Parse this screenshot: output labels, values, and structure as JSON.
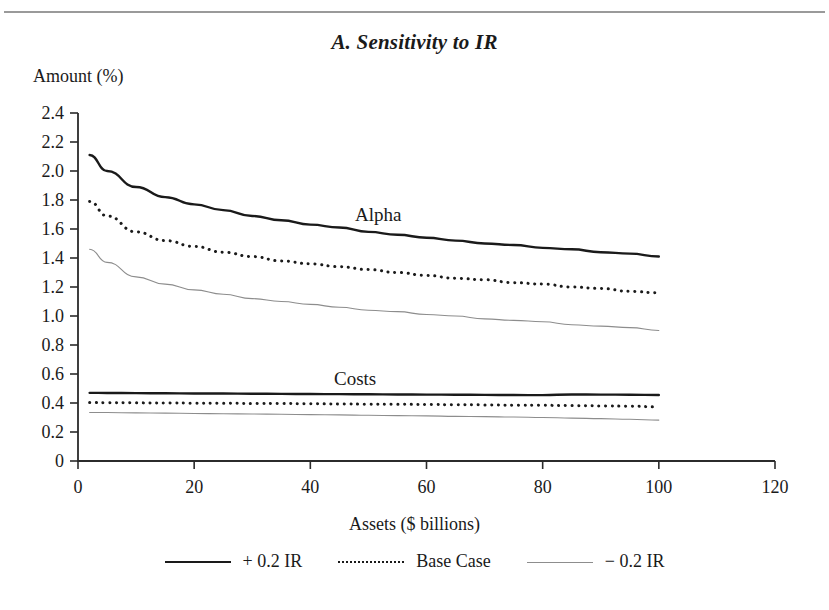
{
  "page": {
    "background_color": "#ffffff",
    "rule_color": "#9a9a9a"
  },
  "header": {
    "title": "A. Sensitivity to IR"
  },
  "annotations": {
    "alpha_label": "Alpha",
    "costs_label": "Costs"
  },
  "legend": {
    "items": [
      {
        "label": "+ 0.2 IR",
        "style": "solid",
        "color": "#1a1a1a"
      },
      {
        "label": "Base Case",
        "style": "dotted",
        "color": "#1a1a1a"
      },
      {
        "label": "− 0.2 IR",
        "style": "thin",
        "color": "#8d8d8d"
      }
    ]
  },
  "chart_data": {
    "type": "line",
    "title": "A. Sensitivity to IR",
    "xlabel": "Assets ($ billions)",
    "ylabel": "Amount (%)",
    "xlim": [
      0,
      120
    ],
    "ylim": [
      0,
      2.4
    ],
    "grid": false,
    "legend_position": "bottom",
    "xticks": [
      "0",
      "20",
      "40",
      "60",
      "80",
      "100",
      "120"
    ],
    "xtick_values": [
      0,
      20,
      40,
      60,
      80,
      100,
      120
    ],
    "yticks": [
      "0",
      "0.2",
      "0.4",
      "0.6",
      "0.8",
      "1.0",
      "1.2",
      "1.4",
      "1.6",
      "1.8",
      "2.0",
      "2.2",
      "2.4"
    ],
    "ytick_values": [
      0,
      0.2,
      0.4,
      0.6,
      0.8,
      1.0,
      1.2,
      1.4,
      1.6,
      1.8,
      2.0,
      2.2,
      2.4
    ],
    "x": [
      2,
      5,
      10,
      15,
      20,
      25,
      30,
      35,
      40,
      45,
      50,
      55,
      60,
      65,
      70,
      75,
      80,
      85,
      90,
      95,
      100
    ],
    "series": [
      {
        "name": "+ 0.2 IR",
        "group": "Alpha",
        "style": "solid",
        "color": "#1a1a1a",
        "values": [
          2.11,
          2.0,
          1.89,
          1.82,
          1.77,
          1.73,
          1.69,
          1.66,
          1.63,
          1.61,
          1.58,
          1.56,
          1.54,
          1.52,
          1.5,
          1.49,
          1.47,
          1.46,
          1.44,
          1.43,
          1.41
        ]
      },
      {
        "name": "Base Case",
        "group": "Alpha",
        "style": "dotted",
        "color": "#1a1a1a",
        "values": [
          1.79,
          1.69,
          1.58,
          1.52,
          1.48,
          1.44,
          1.41,
          1.38,
          1.36,
          1.34,
          1.32,
          1.3,
          1.28,
          1.26,
          1.25,
          1.23,
          1.22,
          1.2,
          1.19,
          1.17,
          1.16
        ]
      },
      {
        "name": "− 0.2 IR",
        "group": "Alpha",
        "style": "thin",
        "color": "#8d8d8d",
        "values": [
          1.46,
          1.37,
          1.27,
          1.22,
          1.18,
          1.15,
          1.12,
          1.1,
          1.08,
          1.06,
          1.04,
          1.03,
          1.01,
          1.0,
          0.98,
          0.97,
          0.96,
          0.94,
          0.93,
          0.92,
          0.9
        ]
      },
      {
        "name": "+ 0.2 IR",
        "group": "Costs",
        "style": "solid",
        "color": "#1a1a1a",
        "values": [
          0.47,
          0.469,
          0.468,
          0.467,
          0.466,
          0.465,
          0.464,
          0.463,
          0.462,
          0.461,
          0.46,
          0.459,
          0.458,
          0.457,
          0.456,
          0.455,
          0.454,
          0.459,
          0.458,
          0.457,
          0.455
        ]
      },
      {
        "name": "Base Case",
        "group": "Costs",
        "style": "dotted",
        "color": "#1a1a1a",
        "values": [
          0.403,
          0.402,
          0.401,
          0.4,
          0.399,
          0.398,
          0.397,
          0.396,
          0.395,
          0.393,
          0.392,
          0.391,
          0.39,
          0.388,
          0.387,
          0.385,
          0.384,
          0.382,
          0.38,
          0.378,
          0.373
        ]
      },
      {
        "name": "− 0.2 IR",
        "group": "Costs",
        "style": "thin",
        "color": "#8d8d8d",
        "values": [
          0.335,
          0.334,
          0.332,
          0.33,
          0.328,
          0.326,
          0.324,
          0.322,
          0.32,
          0.318,
          0.315,
          0.313,
          0.311,
          0.308,
          0.306,
          0.303,
          0.3,
          0.296,
          0.292,
          0.288,
          0.282
        ]
      }
    ]
  }
}
